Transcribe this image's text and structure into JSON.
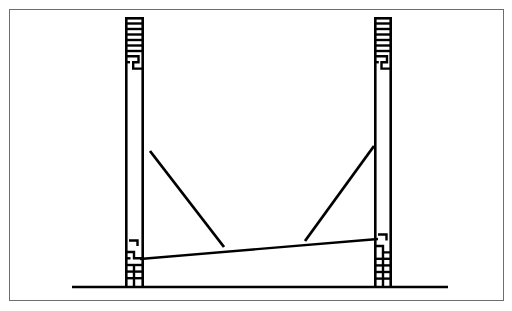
{
  "figure": {
    "domain": "Diagram",
    "title": "Two-column portal frame elevation with sagging beam",
    "background_color": "#ffffff",
    "ink_color": "#000000",
    "frame_border_color": "#6e6e6e",
    "canvas": {
      "width": 512,
      "height": 311
    },
    "frame_box": {
      "x": 9,
      "y": 9,
      "width": 495,
      "height": 292,
      "stroke_width": 1.5
    }
  },
  "elements": {
    "left_column": {
      "label": "Left column",
      "x_outer": 125,
      "x_inner": 144,
      "y_top": 17,
      "y_bottom": 288,
      "width": 19,
      "edge_stroke_width": 2.6,
      "hatched_top": {
        "y_start": 17,
        "y_end": 62,
        "rungs": 8
      },
      "hatched_bottom": {
        "y_start": 238,
        "y_end": 288,
        "rungs": 5
      },
      "plain_middle": {
        "y_start": 62,
        "y_end": 238
      }
    },
    "right_column": {
      "label": "Right column",
      "x_outer": 374,
      "x_inner": 392,
      "y_top": 17,
      "y_bottom": 288,
      "width": 18,
      "edge_stroke_width": 2.6,
      "hatched_top": {
        "y_start": 17,
        "y_end": 62,
        "rungs": 8
      },
      "hatched_bottom": {
        "y_start": 232,
        "y_end": 288,
        "rungs": 5
      },
      "plain_middle": {
        "y_start": 62,
        "y_end": 232
      }
    },
    "beam": {
      "label": "Sloping beam",
      "x_start": 140,
      "y_start": 259,
      "x_end": 378,
      "y_end": 239,
      "stroke_width": 2.4
    },
    "left_brace": {
      "label": "Left diagonal brace",
      "x_start": 150,
      "y_start": 151,
      "x_end": 224,
      "y_end": 247,
      "stroke_width": 2.8
    },
    "right_brace": {
      "label": "Right diagonal brace",
      "x_start": 305,
      "y_start": 241,
      "x_end": 374,
      "y_end": 146,
      "stroke_width": 2.8
    },
    "ground_line": {
      "label": "Ground line",
      "x_start": 72,
      "x_end": 448,
      "y": 287,
      "stroke_width": 2.4
    }
  },
  "notes": {
    "text_labels": [],
    "dimension_labels": [],
    "caption": ""
  }
}
